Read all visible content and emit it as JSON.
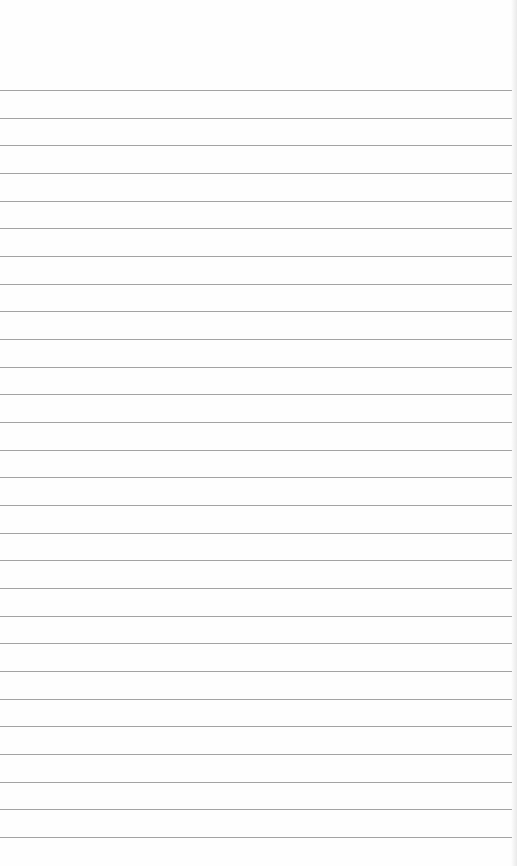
{
  "paper": {
    "type": "ruled-notebook-paper",
    "background_color": "#fefefe",
    "line_color": "#a3a3a3",
    "line_count": 28,
    "first_line_y": 90,
    "line_spacing": 27.67,
    "line_width": 512
  }
}
